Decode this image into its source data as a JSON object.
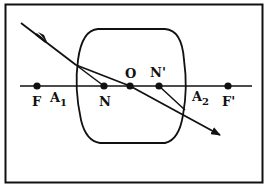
{
  "diagram": {
    "type": "thick-lens-ray-diagram",
    "colors": {
      "stroke": "#111111",
      "background": "#ffffff"
    },
    "points": {
      "F": {
        "label": "F"
      },
      "A1": {
        "label": "A",
        "sub": "1"
      },
      "N": {
        "label": "N"
      },
      "O": {
        "label": "O"
      },
      "N_prime": {
        "label": "N'"
      },
      "A2": {
        "label": "A",
        "sub": "2"
      },
      "F_prime": {
        "label": "F'"
      }
    }
  }
}
